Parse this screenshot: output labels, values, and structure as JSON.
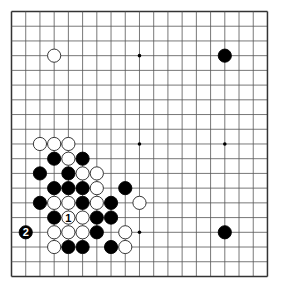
{
  "diagram": {
    "type": "go-board",
    "size": 19,
    "origin": {
      "x": 11.5,
      "y": 11.5
    },
    "spacing": {
      "x": 14.22,
      "y": 14.72
    },
    "stone_radius": 6.6,
    "colors": {
      "background": "#ffffff",
      "line": "#555555",
      "border": "#333333",
      "black": "#000000",
      "white": "#ffffff",
      "white_outline": "#222222"
    },
    "star_points": [
      [
        3,
        3
      ],
      [
        9,
        3
      ],
      [
        15,
        3
      ],
      [
        3,
        9
      ],
      [
        9,
        9
      ],
      [
        15,
        9
      ],
      [
        3,
        15
      ],
      [
        9,
        15
      ],
      [
        15,
        15
      ]
    ],
    "stones": [
      {
        "col": 3,
        "row": 3,
        "color": "white"
      },
      {
        "col": 15,
        "row": 3,
        "color": "black"
      },
      {
        "col": 2,
        "row": 9,
        "color": "white"
      },
      {
        "col": 3,
        "row": 9,
        "color": "white"
      },
      {
        "col": 4,
        "row": 9,
        "color": "white"
      },
      {
        "col": 3,
        "row": 10,
        "color": "black"
      },
      {
        "col": 4,
        "row": 10,
        "color": "white"
      },
      {
        "col": 5,
        "row": 10,
        "color": "black"
      },
      {
        "col": 2,
        "row": 11,
        "color": "black"
      },
      {
        "col": 4,
        "row": 11,
        "color": "black"
      },
      {
        "col": 5,
        "row": 11,
        "color": "white"
      },
      {
        "col": 6,
        "row": 11,
        "color": "white"
      },
      {
        "col": 3,
        "row": 12,
        "color": "black"
      },
      {
        "col": 4,
        "row": 12,
        "color": "black"
      },
      {
        "col": 5,
        "row": 12,
        "color": "black"
      },
      {
        "col": 6,
        "row": 12,
        "color": "white"
      },
      {
        "col": 8,
        "row": 12,
        "color": "black"
      },
      {
        "col": 2,
        "row": 13,
        "color": "black"
      },
      {
        "col": 3,
        "row": 13,
        "color": "white"
      },
      {
        "col": 4,
        "row": 13,
        "color": "white"
      },
      {
        "col": 5,
        "row": 13,
        "color": "black"
      },
      {
        "col": 6,
        "row": 13,
        "color": "white"
      },
      {
        "col": 7,
        "row": 13,
        "color": "black"
      },
      {
        "col": 9,
        "row": 13,
        "color": "white"
      },
      {
        "col": 3,
        "row": 14,
        "color": "black"
      },
      {
        "col": 4,
        "row": 14,
        "color": "white",
        "label": "1"
      },
      {
        "col": 5,
        "row": 14,
        "color": "white"
      },
      {
        "col": 6,
        "row": 14,
        "color": "black"
      },
      {
        "col": 7,
        "row": 14,
        "color": "black"
      },
      {
        "col": 1,
        "row": 15,
        "color": "black",
        "label": "2"
      },
      {
        "col": 3,
        "row": 15,
        "color": "white"
      },
      {
        "col": 4,
        "row": 15,
        "color": "white"
      },
      {
        "col": 5,
        "row": 15,
        "color": "white"
      },
      {
        "col": 6,
        "row": 15,
        "color": "black"
      },
      {
        "col": 8,
        "row": 15,
        "color": "white"
      },
      {
        "col": 15,
        "row": 15,
        "color": "black"
      },
      {
        "col": 3,
        "row": 16,
        "color": "white"
      },
      {
        "col": 4,
        "row": 16,
        "color": "black"
      },
      {
        "col": 5,
        "row": 16,
        "color": "black"
      },
      {
        "col": 7,
        "row": 16,
        "color": "black"
      },
      {
        "col": 8,
        "row": 16,
        "color": "white"
      }
    ]
  }
}
